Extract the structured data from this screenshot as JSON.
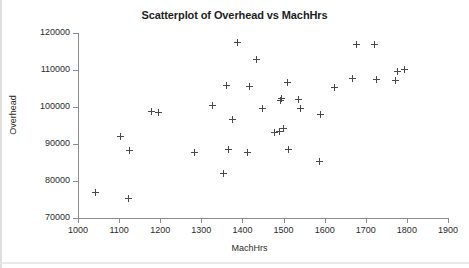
{
  "chart_data": {
    "type": "scatter",
    "title": "Scatterplot of Overhead vs MachHrs",
    "xlabel": "MachHrs",
    "ylabel": "Overhead",
    "xlim": [
      1000,
      1900
    ],
    "ylim": [
      70000,
      120000
    ],
    "xticks": [
      1000,
      1100,
      1200,
      1300,
      1400,
      1500,
      1600,
      1700,
      1800,
      1900
    ],
    "yticks": [
      70000,
      80000,
      90000,
      100000,
      110000,
      120000
    ],
    "grid": false,
    "legend": null,
    "marker": "plus",
    "marker_color": "#4a4a4a",
    "points": [
      {
        "x": 1043,
        "y": 76800
      },
      {
        "x": 1104,
        "y": 91900
      },
      {
        "x": 1122,
        "y": 75300
      },
      {
        "x": 1125,
        "y": 88300
      },
      {
        "x": 1178,
        "y": 98800
      },
      {
        "x": 1196,
        "y": 98600
      },
      {
        "x": 1284,
        "y": 87600
      },
      {
        "x": 1328,
        "y": 100400
      },
      {
        "x": 1355,
        "y": 82100
      },
      {
        "x": 1362,
        "y": 105800
      },
      {
        "x": 1367,
        "y": 88600
      },
      {
        "x": 1376,
        "y": 96700
      },
      {
        "x": 1389,
        "y": 117500
      },
      {
        "x": 1412,
        "y": 87800
      },
      {
        "x": 1416,
        "y": 105500
      },
      {
        "x": 1435,
        "y": 112800
      },
      {
        "x": 1448,
        "y": 99500
      },
      {
        "x": 1479,
        "y": 93000
      },
      {
        "x": 1489,
        "y": 93400
      },
      {
        "x": 1493,
        "y": 101800
      },
      {
        "x": 1494,
        "y": 102200
      },
      {
        "x": 1501,
        "y": 94200
      },
      {
        "x": 1509,
        "y": 106600
      },
      {
        "x": 1513,
        "y": 88500
      },
      {
        "x": 1537,
        "y": 102100
      },
      {
        "x": 1540,
        "y": 99500
      },
      {
        "x": 1588,
        "y": 85200
      },
      {
        "x": 1590,
        "y": 98100
      },
      {
        "x": 1623,
        "y": 105400
      },
      {
        "x": 1667,
        "y": 107600
      },
      {
        "x": 1678,
        "y": 116800
      },
      {
        "x": 1721,
        "y": 116800
      },
      {
        "x": 1725,
        "y": 107400
      },
      {
        "x": 1773,
        "y": 107200
      },
      {
        "x": 1776,
        "y": 109700
      },
      {
        "x": 1793,
        "y": 110200
      }
    ]
  }
}
